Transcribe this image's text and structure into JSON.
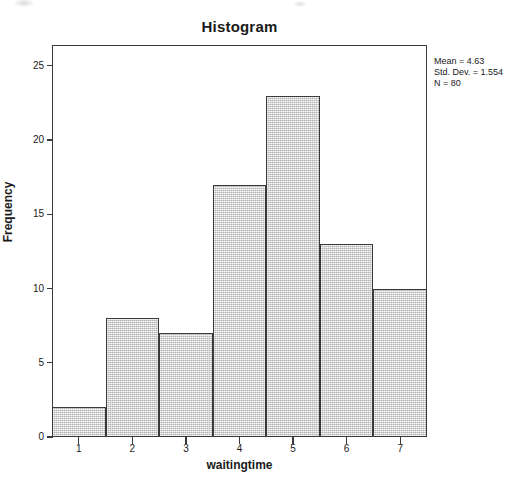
{
  "chart_data": {
    "type": "bar",
    "title": "Histogram",
    "xlabel": "waitingtime",
    "ylabel": "Frequency",
    "categories": [
      "1",
      "2",
      "3",
      "4",
      "5",
      "6",
      "7"
    ],
    "values": [
      2,
      8,
      7,
      17,
      23,
      13,
      10
    ],
    "x_tick_labels": [
      "1",
      "2",
      "3",
      "4",
      "5",
      "6",
      "7"
    ],
    "y_tick_labels": [
      "0",
      "5",
      "10",
      "15",
      "20",
      "25"
    ],
    "y_tick_values": [
      0,
      5,
      10,
      15,
      20,
      25
    ],
    "xlim": [
      0.5,
      7.5
    ],
    "ylim": [
      0,
      26.4
    ],
    "bin_width": 1,
    "grid": false,
    "legend": false,
    "bar_fill_color": "#d4d4d4",
    "bar_edge_color": "#3a3a3a",
    "annotations": {
      "mean_label": "Mean = 4.63",
      "std_dev_label": "Std. Dev. = 1.554",
      "n_label": "N = 80",
      "mean": 4.63,
      "std_dev": 1.554,
      "n": 80
    }
  }
}
